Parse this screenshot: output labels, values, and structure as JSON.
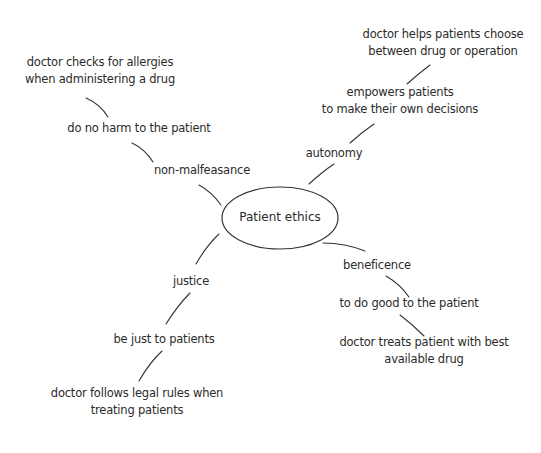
{
  "diagram": {
    "type": "mind-map",
    "center": {
      "label": "Patient ethics"
    },
    "branches": [
      {
        "id": "non-malfeasance",
        "label": "non-malfeasance",
        "children": [
          {
            "label": "do no harm to the patient",
            "children": [
              {
                "lines": [
                  "doctor checks for allergies",
                  "when administering a drug"
                ]
              }
            ]
          }
        ]
      },
      {
        "id": "autonomy",
        "label": "autonomy",
        "children": [
          {
            "lines": [
              "empowers patients",
              "to make their own decisions"
            ],
            "children": [
              {
                "lines": [
                  "doctor helps patients choose",
                  "between drug or operation"
                ]
              }
            ]
          }
        ]
      },
      {
        "id": "beneficence",
        "label": "beneficence",
        "children": [
          {
            "label": "to do good to the patient",
            "children": [
              {
                "lines": [
                  "doctor treats patient with best",
                  "available drug"
                ]
              }
            ]
          }
        ]
      },
      {
        "id": "justice",
        "label": "justice",
        "children": [
          {
            "label": "be just to patients",
            "children": [
              {
                "lines": [
                  "doctor follows legal rules when",
                  "treating patients"
                ]
              }
            ]
          }
        ]
      }
    ]
  }
}
